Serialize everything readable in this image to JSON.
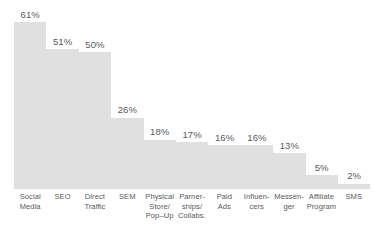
{
  "chart_data": {
    "type": "bar",
    "title": "",
    "subtitle": "",
    "xlabel": "",
    "ylabel": "",
    "ylim": [
      0,
      61
    ],
    "grid": false,
    "legend": false,
    "value_suffix": "%",
    "categories": [
      "Social Media",
      "SEO",
      "Direct Traffic",
      "SEM",
      "Physical Store/ Pop-Up",
      "Parner-ships/ Collabs.",
      "Paid Ads",
      "Influencers",
      "Messenger",
      "Affiliate Program",
      "SMS"
    ],
    "values": [
      61,
      51,
      50,
      26,
      18,
      17,
      16,
      16,
      13,
      5,
      2
    ],
    "value_labels": [
      "61%",
      "51%",
      "50%",
      "26%",
      "18%",
      "17%",
      "16%",
      "16%",
      "13%",
      "5%",
      "2%"
    ],
    "category_label_lines": [
      [
        "Social",
        "Media"
      ],
      [
        "SEO"
      ],
      [
        "Direct",
        "Traffic"
      ],
      [
        "SEM"
      ],
      [
        "Physical",
        "Store/",
        "Pop–Up"
      ],
      [
        "Parner-",
        "ships/",
        "Collabs."
      ],
      [
        "Paid",
        "Ads"
      ],
      [
        "Influen-",
        "cers"
      ],
      [
        "Messen-",
        "ger"
      ],
      [
        "Affiliate",
        "Program"
      ],
      [
        "SMS"
      ]
    ],
    "colors": {
      "bar_fill": "#e0e0e0",
      "background": "#ffffff",
      "value_text": "#58595b",
      "category_text": "#58595b"
    }
  }
}
